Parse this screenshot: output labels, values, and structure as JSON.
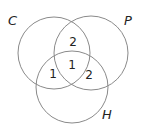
{
  "diagram": {
    "type": "venn",
    "sets": [
      {
        "id": "C",
        "label": "C",
        "cx": 54,
        "cy": 53,
        "r": 36,
        "label_x": 8,
        "label_y": 25
      },
      {
        "id": "P",
        "label": "P",
        "cx": 91,
        "cy": 53,
        "r": 37,
        "label_x": 125,
        "label_y": 25
      },
      {
        "id": "H",
        "label": "H",
        "cx": 72,
        "cy": 87,
        "r": 36,
        "label_x": 103,
        "label_y": 119
      }
    ],
    "regions": [
      {
        "sets": [
          "C",
          "P"
        ],
        "value": "2",
        "x": 73,
        "y": 46
      },
      {
        "sets": [
          "C",
          "P",
          "H"
        ],
        "value": "1",
        "x": 72,
        "y": 69
      },
      {
        "sets": [
          "C",
          "H"
        ],
        "value": "1",
        "x": 53,
        "y": 78
      },
      {
        "sets": [
          "P",
          "H"
        ],
        "value": "2",
        "x": 89,
        "y": 78
      }
    ],
    "stroke_color": "#8a8a8a",
    "text_color": "#222222"
  }
}
